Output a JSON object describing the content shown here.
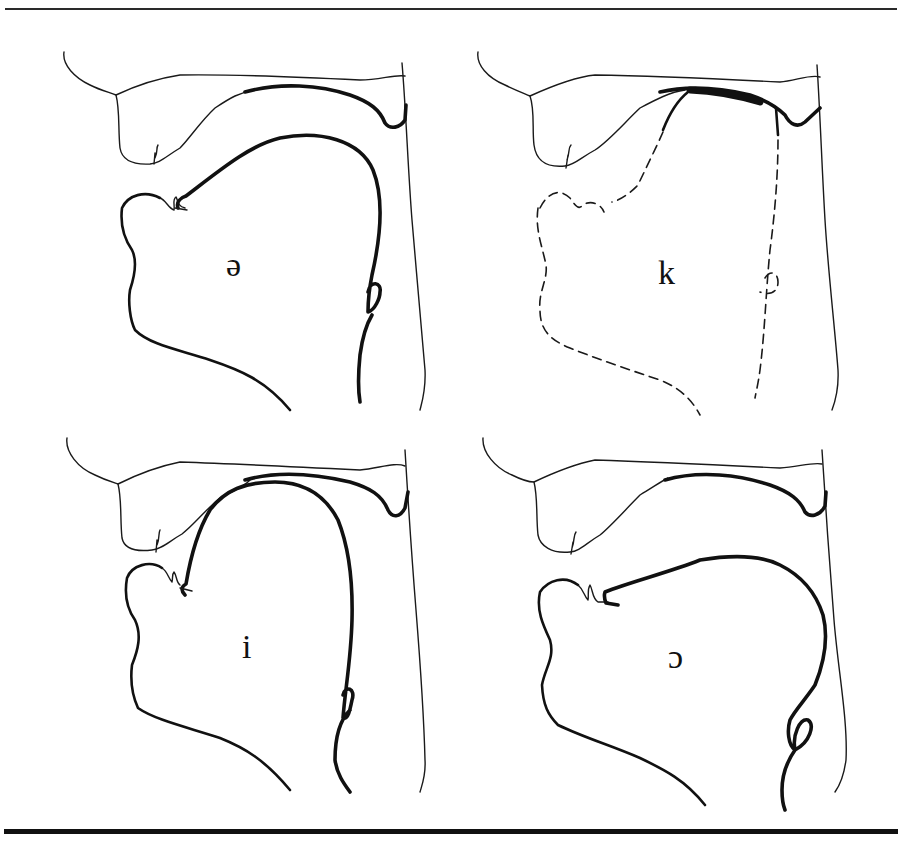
{
  "figure": {
    "type": "midsagittal vocal tract diagrams",
    "panels": [
      {
        "position": "top-left",
        "symbol": "ə",
        "tongue_style": "solid"
      },
      {
        "position": "top-right",
        "symbol": "k",
        "tongue_style": "dashed"
      },
      {
        "position": "bottom-left",
        "symbol": "i",
        "tongue_style": "solid"
      },
      {
        "position": "bottom-right",
        "symbol": "ɔ",
        "tongue_style": "solid"
      }
    ]
  },
  "colors": {
    "line": "#111111",
    "background": "#ffffff"
  }
}
